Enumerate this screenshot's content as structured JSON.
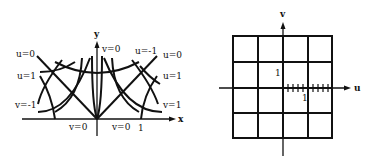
{
  "left_panel": {
    "title": "xy-plane",
    "axis_labels": {
      "x": "x",
      "y": "y"
    },
    "curve_labels": {
      "top_v0": "v=0",
      "top_u_neg1": "u=-1",
      "left_u0": "u=0",
      "left_u1": "u=1",
      "left_v_neg1": "v=-1",
      "right_u0": "u=0",
      "right_u1": "u=1",
      "right_v1": "v=1",
      "bottom_left_v0": "v=0",
      "bottom_right_v0": "v=0",
      "x_tick_1": "1"
    }
  },
  "right_panel": {
    "title": "uv-plane",
    "axis_labels": {
      "u": "u",
      "v": "v"
    },
    "tick_labels": {
      "v_1": "1",
      "u_1": "1"
    },
    "grid": {
      "columns": 4,
      "rows": 4
    }
  },
  "colors": {
    "ink": "#111111",
    "background": "#ffffff"
  }
}
